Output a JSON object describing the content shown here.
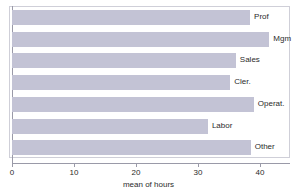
{
  "chart_data": {
    "type": "bar",
    "orientation": "horizontal",
    "title": "",
    "subtitle": "",
    "xlabel": "mean of hours",
    "ylabel": "",
    "categories": [
      "Prof",
      "Mgm",
      "Sales",
      "Cler.",
      "Operat.",
      "Labor",
      "Other"
    ],
    "values": [
      38.4,
      41.5,
      36.1,
      35.2,
      39.0,
      31.6,
      38.5
    ],
    "series": [
      {
        "name": "mean of hours",
        "values": [
          38.4,
          41.5,
          36.1,
          35.2,
          39.0,
          31.6,
          38.5
        ]
      }
    ],
    "xlim": [
      0,
      44.8
    ],
    "xticks": [
      0,
      10,
      20,
      30,
      40
    ],
    "xtick_labels": [
      "0",
      "10",
      "20",
      "30",
      "40"
    ],
    "grid": false,
    "legend": false,
    "legend_position": "none",
    "bar_color": "#c3c3d5",
    "axis_color": "#9a9aa8",
    "frame_color": "#cfcfd8",
    "background_color": "#ffffff",
    "label_color": "#2b2b2b"
  }
}
